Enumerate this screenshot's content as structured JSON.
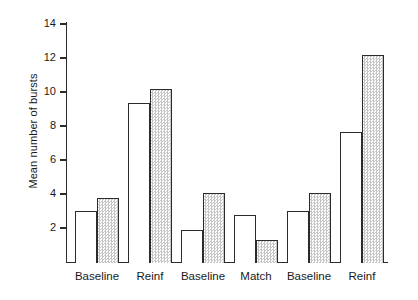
{
  "chart_data": {
    "type": "bar",
    "title": "",
    "xlabel": "",
    "ylabel": "Mean number of bursts",
    "categories": [
      "Baseline",
      "Reinf",
      "Baseline",
      "Match",
      "Baseline",
      "Reinf"
    ],
    "series": [
      {
        "name": "open",
        "values": [
          3.0,
          9.35,
          1.9,
          2.75,
          3.0,
          7.65
        ]
      },
      {
        "name": "stippled",
        "values": [
          3.75,
          10.15,
          4.05,
          1.3,
          4.05,
          12.15
        ]
      }
    ],
    "ylim": [
      0,
      14
    ],
    "y_ticks": [
      2,
      4,
      6,
      8,
      10,
      12,
      14
    ],
    "y_tick_labels": [
      "2",
      "4",
      "6",
      "8",
      "10",
      "12",
      "14"
    ],
    "grid": false,
    "legend": "none",
    "colors": {
      "axis": "#2b2b2b",
      "open_bar_fill": "#ffffff",
      "stippled_bar_fill": "#efefef",
      "background": "#ffffff"
    }
  }
}
